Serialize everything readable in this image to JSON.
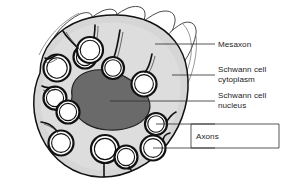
{
  "figure": {
    "background_color": "#ffffff",
    "colors": {
      "cytoplasm_fill": "#d6d6d6",
      "cytoplasm_fill_light": "#e3e3e3",
      "nucleus_fill": "#6a6a6a",
      "axon_fill": "#ffffff",
      "outline": "#1a1a1a",
      "flap_fill": "#ffffff",
      "leader_line": "#2b2b2b",
      "label_text": "#1c1c1c"
    }
  },
  "labels": [
    {
      "id": "mesaxon",
      "text": "Mesaxon",
      "x": 218,
      "y": 47
    },
    {
      "id": "schwann-cytoplasm-1",
      "text": "Schwann cell",
      "x": 218,
      "y": 72
    },
    {
      "id": "schwann-cytoplasm-2",
      "text": "cytoplasm",
      "x": 218,
      "y": 82
    },
    {
      "id": "schwann-nucleus-1",
      "text": "Schwann cell",
      "x": 218,
      "y": 98
    },
    {
      "id": "schwann-nucleus-2",
      "text": "nucleus",
      "x": 218,
      "y": 108
    },
    {
      "id": "axons",
      "text": "Axons",
      "x": 218,
      "y": 135
    }
  ],
  "structures": {
    "mesaxon": "Mesaxon",
    "schwann_cell_cytoplasm": "Schwann cell cytoplasm",
    "schwann_cell_nucleus": "Schwann cell nucleus",
    "axons": "Axons"
  },
  "axon_count": 12,
  "mesaxon_flap_count": 5
}
